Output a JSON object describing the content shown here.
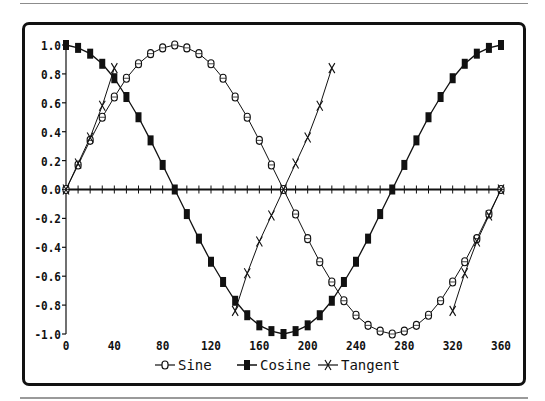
{
  "chart_data": {
    "type": "line",
    "title": "",
    "xlabel": "",
    "ylabel": "",
    "xlim": [
      0,
      360
    ],
    "ylim": [
      -1.0,
      1.0
    ],
    "x_ticks": [
      "0",
      "40",
      "80",
      "120",
      "160",
      "200",
      "240",
      "280",
      "320",
      "360"
    ],
    "y_ticks": [
      "1.0",
      "0.8",
      "0.6",
      "0.4",
      "0.2",
      "0.0",
      "-0.2",
      "-0.4",
      "-0.6",
      "-0.8",
      "-1.0"
    ],
    "grid": false,
    "legend_position": "bottom",
    "series": [
      {
        "name": "Sine",
        "marker": "circle-bar",
        "x": [
          0,
          10,
          20,
          30,
          40,
          50,
          60,
          70,
          80,
          90,
          100,
          110,
          120,
          130,
          140,
          150,
          160,
          170,
          180,
          190,
          200,
          210,
          220,
          230,
          240,
          250,
          260,
          270,
          280,
          290,
          300,
          310,
          320,
          330,
          340,
          350,
          360
        ],
        "values": [
          0,
          0.17,
          0.34,
          0.5,
          0.64,
          0.77,
          0.87,
          0.94,
          0.98,
          1.0,
          0.98,
          0.94,
          0.87,
          0.77,
          0.64,
          0.5,
          0.34,
          0.17,
          0,
          -0.17,
          -0.34,
          -0.5,
          -0.64,
          -0.77,
          -0.87,
          -0.94,
          -0.98,
          -1.0,
          -0.98,
          -0.94,
          -0.87,
          -0.77,
          -0.64,
          -0.5,
          -0.34,
          -0.17,
          0
        ]
      },
      {
        "name": "Cosine",
        "marker": "filled-rect",
        "x": [
          0,
          10,
          20,
          30,
          40,
          50,
          60,
          70,
          80,
          90,
          100,
          110,
          120,
          130,
          140,
          150,
          160,
          170,
          180,
          190,
          200,
          210,
          220,
          230,
          240,
          250,
          260,
          270,
          280,
          290,
          300,
          310,
          320,
          330,
          340,
          350,
          360
        ],
        "values": [
          1.0,
          0.98,
          0.94,
          0.87,
          0.77,
          0.64,
          0.5,
          0.34,
          0.17,
          0,
          -0.17,
          -0.34,
          -0.5,
          -0.64,
          -0.77,
          -0.87,
          -0.94,
          -0.98,
          -1.0,
          -0.98,
          -0.94,
          -0.87,
          -0.77,
          -0.64,
          -0.5,
          -0.34,
          -0.17,
          0,
          0.17,
          0.34,
          0.5,
          0.64,
          0.77,
          0.87,
          0.94,
          0.98,
          1.0
        ]
      },
      {
        "name": "Tangent",
        "marker": "x",
        "segments": [
          {
            "x": [
              0,
              10,
              20,
              30,
              40
            ],
            "values": [
              0,
              0.18,
              0.36,
              0.58,
              0.84
            ]
          },
          {
            "x": [
              140,
              150,
              160,
              170,
              180,
              190,
              200,
              210,
              220
            ],
            "values": [
              -0.84,
              -0.58,
              -0.36,
              -0.18,
              0,
              0.18,
              0.36,
              0.58,
              0.84
            ]
          },
          {
            "x": [
              320,
              330,
              340,
              350,
              360
            ],
            "values": [
              -0.84,
              -0.58,
              -0.36,
              -0.18,
              0
            ]
          }
        ]
      }
    ]
  },
  "legend": {
    "items": [
      {
        "label": "Sine",
        "icon": "circle-bar-marker"
      },
      {
        "label": "Cosine",
        "icon": "filled-rect-marker"
      },
      {
        "label": "Tangent",
        "icon": "x-marker"
      }
    ]
  }
}
